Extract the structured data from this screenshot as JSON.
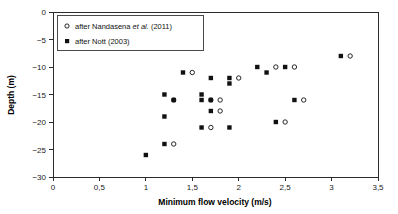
{
  "chart_data": {
    "type": "scatter",
    "title": "",
    "xlabel": "Minimum flow velocity (m/s)",
    "ylabel": "Depth (m)",
    "xlim": [
      0,
      3.5
    ],
    "ylim": [
      -30,
      0
    ],
    "grid": false,
    "xticks": [
      0,
      0.5,
      1,
      1.5,
      2,
      2.5,
      3,
      3.5
    ],
    "xtick_labels": [
      "0",
      "0,5",
      "1",
      "1,5",
      "2",
      "2,5",
      "3",
      "3,5"
    ],
    "yticks": [
      0,
      -5,
      -10,
      -15,
      -20,
      -25,
      -30
    ],
    "ytick_labels": [
      "0",
      "−5",
      "−10",
      "−15",
      "−20",
      "−25",
      "−30"
    ],
    "legend_position": "top-left",
    "series": [
      {
        "name": "after Nandasena et al. (2011)",
        "name_prefix": "after Nandasena ",
        "name_italic": "et al.",
        "name_suffix": " (2011)",
        "marker": "open-circle",
        "color": "#111111",
        "points": [
          {
            "x": 1.3,
            "y": -24
          },
          {
            "x": 1.3,
            "y": -16
          },
          {
            "x": 1.5,
            "y": -11
          },
          {
            "x": 1.7,
            "y": -21
          },
          {
            "x": 1.7,
            "y": -16
          },
          {
            "x": 1.8,
            "y": -18
          },
          {
            "x": 1.8,
            "y": -16
          },
          {
            "x": 2.0,
            "y": -12
          },
          {
            "x": 2.4,
            "y": -10
          },
          {
            "x": 2.5,
            "y": -20
          },
          {
            "x": 2.6,
            "y": -10
          },
          {
            "x": 2.7,
            "y": -16
          },
          {
            "x": 3.2,
            "y": -8
          }
        ]
      },
      {
        "name": "after Nott (2003)",
        "marker": "filled-square",
        "color": "#111111",
        "points": [
          {
            "x": 1.0,
            "y": -26
          },
          {
            "x": 1.2,
            "y": -24
          },
          {
            "x": 1.2,
            "y": -19
          },
          {
            "x": 1.2,
            "y": -15
          },
          {
            "x": 1.3,
            "y": -16
          },
          {
            "x": 1.4,
            "y": -11
          },
          {
            "x": 1.6,
            "y": -16
          },
          {
            "x": 1.6,
            "y": -15
          },
          {
            "x": 1.6,
            "y": -21
          },
          {
            "x": 1.7,
            "y": -12
          },
          {
            "x": 1.7,
            "y": -16
          },
          {
            "x": 1.7,
            "y": -18
          },
          {
            "x": 1.9,
            "y": -12
          },
          {
            "x": 1.9,
            "y": -13
          },
          {
            "x": 1.9,
            "y": -21
          },
          {
            "x": 2.2,
            "y": -10
          },
          {
            "x": 2.3,
            "y": -11
          },
          {
            "x": 2.4,
            "y": -20
          },
          {
            "x": 2.5,
            "y": -10
          },
          {
            "x": 2.6,
            "y": -16
          },
          {
            "x": 3.1,
            "y": -8
          }
        ]
      }
    ]
  }
}
